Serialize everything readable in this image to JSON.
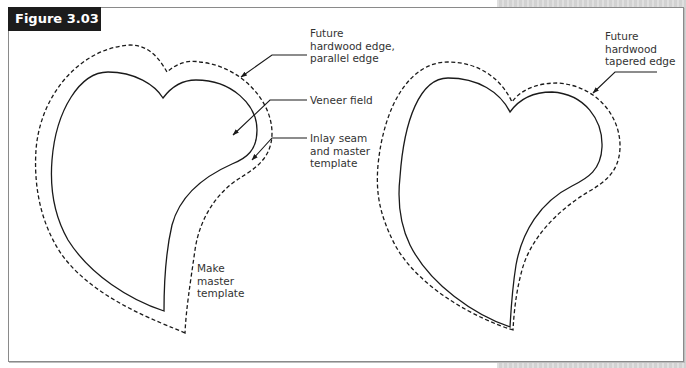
{
  "figure": {
    "label": "Figure 3.03"
  },
  "callouts": {
    "left_outer": "Future\nhardwood edge,\nparallel edge",
    "left_field": "Veneer field",
    "left_seam": "Inlay seam\nand master\ntemplate",
    "left_make": "Make\nmaster\ntemplate",
    "right_outer": "Future\nhardwood\ntapered edge"
  },
  "colors": {
    "line": "#1a1a1a",
    "label_bg": "#1c1c1c",
    "label_text": "#ffffff",
    "page_gray": "#d9d9d9"
  },
  "diagrams": [
    {
      "name": "left-heart",
      "inner": "solid",
      "outer": "dashed parallel offset"
    },
    {
      "name": "right-heart",
      "inner": "solid",
      "outer": "dashed tapered offset"
    }
  ]
}
